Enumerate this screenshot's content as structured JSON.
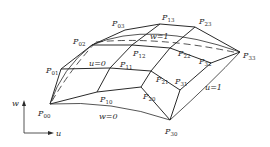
{
  "diagram": {
    "control_points": [
      {
        "id": "P00",
        "label": "P",
        "sub": "00",
        "x": 50,
        "y": 104,
        "lx": 38,
        "ly": 116
      },
      {
        "id": "P10",
        "label": "P",
        "sub": "10",
        "x": 97,
        "y": 92,
        "lx": 100,
        "ly": 102
      },
      {
        "id": "P20",
        "label": "P",
        "sub": "20",
        "x": 141,
        "y": 87,
        "lx": 143,
        "ly": 99
      },
      {
        "id": "P30",
        "label": "P",
        "sub": "30",
        "x": 170,
        "y": 120,
        "lx": 165,
        "ly": 134
      },
      {
        "id": "P01",
        "label": "P",
        "sub": "01",
        "x": 61,
        "y": 69,
        "lx": 46,
        "ly": 73
      },
      {
        "id": "P11",
        "label": "P",
        "sub": "11",
        "x": 110,
        "y": 68,
        "lx": 120,
        "ly": 67
      },
      {
        "id": "P21",
        "label": "P",
        "sub": "21",
        "x": 151,
        "y": 71,
        "lx": 156,
        "ly": 82
      },
      {
        "id": "P31",
        "label": "P",
        "sub": "31",
        "x": 180,
        "y": 90,
        "lx": 175,
        "ly": 84
      },
      {
        "id": "P02",
        "label": "P",
        "sub": "02",
        "x": 92,
        "y": 45,
        "lx": 73,
        "ly": 44
      },
      {
        "id": "P12",
        "label": "P",
        "sub": "12",
        "x": 132,
        "y": 45,
        "lx": 133,
        "ly": 56
      },
      {
        "id": "P22",
        "label": "P",
        "sub": "22",
        "x": 170,
        "y": 48,
        "lx": 178,
        "ly": 56
      },
      {
        "id": "P32",
        "label": "P",
        "sub": "32",
        "x": 211,
        "y": 63,
        "lx": 199,
        "ly": 64
      },
      {
        "id": "P03",
        "label": "P",
        "sub": "03",
        "x": 125,
        "y": 30,
        "lx": 112,
        "ly": 26
      },
      {
        "id": "P13",
        "label": "P",
        "sub": "13",
        "x": 160,
        "y": 24,
        "lx": 162,
        "ly": 20
      },
      {
        "id": "P23",
        "label": "P",
        "sub": "23",
        "x": 195,
        "y": 27,
        "lx": 199,
        "ly": 24
      },
      {
        "id": "P33",
        "label": "P",
        "sub": "33",
        "x": 240,
        "y": 52,
        "lx": 243,
        "ly": 58
      }
    ],
    "boundary_labels": [
      {
        "id": "u0",
        "text": "u=0",
        "x": 89,
        "y": 66
      },
      {
        "id": "w1",
        "text": "w=1",
        "x": 150,
        "y": 39
      },
      {
        "id": "u1",
        "text": "u=1",
        "x": 205,
        "y": 90
      },
      {
        "id": "w0",
        "text": "w=0",
        "x": 99,
        "y": 119
      }
    ],
    "axes": {
      "vertical_label": "w",
      "horizontal_label": "u"
    }
  }
}
